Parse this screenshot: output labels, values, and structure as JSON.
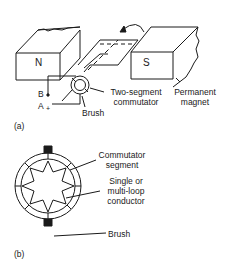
{
  "figure_a": {
    "panel_label": "(a)",
    "north_pole": "N",
    "south_pole": "S",
    "terminal_b": "B",
    "terminal_a": "A",
    "terminal_a_sign": "+",
    "commutator_label_line1": "Two-segment",
    "commutator_label_line2": "commutator",
    "brush_label": "Brush",
    "magnet_label_line1": "Permanent",
    "magnet_label_line2": "magnet"
  },
  "figure_b": {
    "panel_label": "(b)",
    "segment_label_line1": "Commutator",
    "segment_label_line2": "segment",
    "conductor_label_line1": "Single or",
    "conductor_label_line2": "multi-loop",
    "conductor_label_line3": "conductor",
    "brush_label": "Brush"
  },
  "colors": {
    "ink": "#1a1a1a",
    "background": "#ffffff"
  }
}
